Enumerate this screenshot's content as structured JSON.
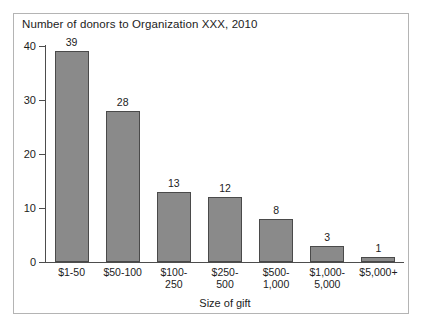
{
  "chart_data": {
    "type": "bar",
    "title": "Number of donors to Organization XXX, 2010",
    "xlabel": "Size of gift",
    "ylabel": "",
    "categories": [
      "$1-50",
      "$50-100",
      "$100-250",
      "$250-500",
      "$500-1,000",
      "$1,000-5,000",
      "$5,000+"
    ],
    "category_lines": [
      [
        "$1-50"
      ],
      [
        "$50-100"
      ],
      [
        "$100-",
        "250"
      ],
      [
        "$250-",
        "500"
      ],
      [
        "$500-",
        "1,000"
      ],
      [
        "$1,000-",
        "5,000"
      ],
      [
        "$5,000+"
      ]
    ],
    "values": [
      39,
      28,
      13,
      12,
      8,
      3,
      1
    ],
    "value_labels": [
      "39",
      "28",
      "13",
      "12",
      "8",
      "3",
      "1"
    ],
    "ylim": [
      0,
      40
    ],
    "yticks": [
      0,
      10,
      20,
      30,
      40
    ],
    "ytick_labels": [
      "0",
      "10",
      "20",
      "30",
      "40"
    ],
    "grid": false,
    "legend": false,
    "bar_color": "#8a8a8a",
    "bar_border_color": "#4a4a4a",
    "axis_color": "#4d4d4d",
    "frame_color": "#b4b4b4",
    "text_color": "#1c1c1c",
    "background": "#ffffff"
  }
}
